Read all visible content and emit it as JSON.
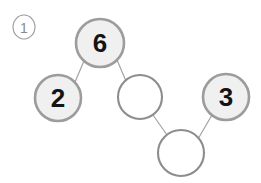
{
  "figure": {
    "marker": {
      "name": "item-number-marker",
      "text": "1",
      "shape": "circled-number",
      "cx": 24,
      "cy": 27,
      "rx": 11,
      "ry": 12,
      "stroke": "#9a9a9a",
      "font_size": 14
    },
    "colors": {
      "background": "#ffffff",
      "filled_node_fill": "#f0f0f0",
      "filled_node_stroke": "#9c9c9c",
      "empty_node_fill": "#ffffff",
      "empty_node_stroke": "#8d8d8d",
      "edge_stroke": "#a3a3a3",
      "label_color": "#141414"
    },
    "nodes": [
      {
        "id": "node-6",
        "name": "node-circle-6",
        "label": "6",
        "filled": true,
        "cx": 100,
        "cy": 43,
        "r": 24,
        "stroke_width": 2.6,
        "font_size": 26
      },
      {
        "id": "node-2",
        "name": "node-circle-2",
        "label": "2",
        "filled": true,
        "cx": 58,
        "cy": 98,
        "r": 23,
        "stroke_width": 2.6,
        "font_size": 26
      },
      {
        "id": "node-empty-middle",
        "name": "node-circle-empty-middle",
        "label": "",
        "filled": false,
        "cx": 140,
        "cy": 97,
        "r": 22,
        "stroke_width": 2.1,
        "font_size": 26
      },
      {
        "id": "node-3",
        "name": "node-circle-3",
        "label": "3",
        "filled": true,
        "cx": 226,
        "cy": 97,
        "r": 23,
        "stroke_width": 2.6,
        "font_size": 26
      },
      {
        "id": "node-empty-bottom",
        "name": "node-circle-empty-bottom",
        "label": "",
        "filled": false,
        "cx": 181,
        "cy": 153,
        "r": 23,
        "stroke_width": 2.1,
        "font_size": 26
      }
    ],
    "edges": [
      {
        "name": "edge-2-to-6",
        "from": "node-2",
        "to": "node-6",
        "x1": 75,
        "y1": 82,
        "x2": 84,
        "y2": 61,
        "stroke_width": 1.2
      },
      {
        "name": "edge-6-to-empty-middle",
        "from": "node-6",
        "to": "node-empty-middle",
        "x1": 117,
        "y1": 60,
        "x2": 126,
        "y2": 81,
        "stroke_width": 1.2
      },
      {
        "name": "edge-empty-middle-to-empty-bottom",
        "from": "node-empty-middle",
        "to": "node-empty-bottom",
        "x1": 153,
        "y1": 115,
        "x2": 167,
        "y2": 135,
        "stroke_width": 1.2
      },
      {
        "name": "edge-empty-bottom-to-3",
        "from": "node-empty-bottom",
        "to": "node-3",
        "x1": 198,
        "y1": 139,
        "x2": 212,
        "y2": 115,
        "stroke_width": 1.2
      }
    ]
  }
}
